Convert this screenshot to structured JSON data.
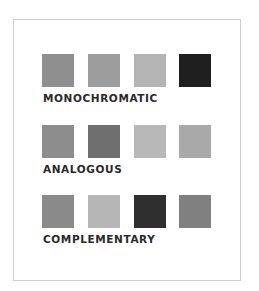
{
  "groups": [
    {
      "label": "MONOCHROMATIC",
      "swatches": [
        "#8f8f8f",
        "#9d9d9d",
        "#b4b4b4",
        "#1f1f1f"
      ]
    },
    {
      "label": "ANALOGOUS",
      "swatches": [
        "#8d8d8d",
        "#6f6f6f",
        "#b8b8b8",
        "#a9a9a9"
      ]
    },
    {
      "label": "COMPLEMENTARY",
      "swatches": [
        "#8a8a8a",
        "#b6b6b6",
        "#2f2f2f",
        "#808080"
      ]
    }
  ]
}
